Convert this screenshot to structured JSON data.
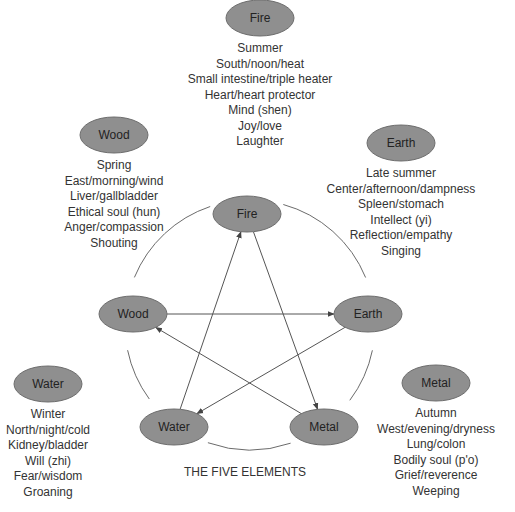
{
  "title": "THE FIVE ELEMENTS",
  "colors": {
    "ellipse_fill": "#8f8f8f",
    "ellipse_stroke": "#6e6e6e",
    "line": "#555555",
    "text": "#333333"
  },
  "elements": [
    {
      "id": "fire",
      "label": "Fire",
      "attributes": [
        "Summer",
        "South/noon/heat",
        "Small intestine/triple heater",
        "Heart/heart protector",
        "Mind (shen)",
        "Joy/love",
        "Laughter"
      ]
    },
    {
      "id": "earth",
      "label": "Earth",
      "attributes": [
        "Late summer",
        "Center/afternoon/dampness",
        "Spleen/stomach",
        "Intellect (yi)",
        "Reflection/empathy",
        "Singing"
      ]
    },
    {
      "id": "metal",
      "label": "Metal",
      "attributes": [
        "Autumn",
        "West/evening/dryness",
        "Lung/colon",
        "Bodily soul (p'o)",
        "Grief/reverence",
        "Weeping"
      ]
    },
    {
      "id": "water",
      "label": "Water",
      "attributes": [
        "Winter",
        "North/night/cold",
        "Kidney/bladder",
        "Will (zhi)",
        "Fear/wisdom",
        "Groaning"
      ]
    },
    {
      "id": "wood",
      "label": "Wood",
      "attributes": [
        "Spring",
        "East/morning/wind",
        "Liver/gallbladder",
        "Ethical soul (hun)",
        "Anger/compassion",
        "Shouting"
      ]
    }
  ],
  "generating_cycle": [
    "Fire",
    "Earth",
    "Metal",
    "Water",
    "Wood"
  ],
  "controlling_cycle": [
    {
      "from": "Water",
      "to": "Fire"
    },
    {
      "from": "Fire",
      "to": "Metal"
    },
    {
      "from": "Metal",
      "to": "Wood"
    },
    {
      "from": "Wood",
      "to": "Earth"
    },
    {
      "from": "Earth",
      "to": "Water"
    }
  ]
}
